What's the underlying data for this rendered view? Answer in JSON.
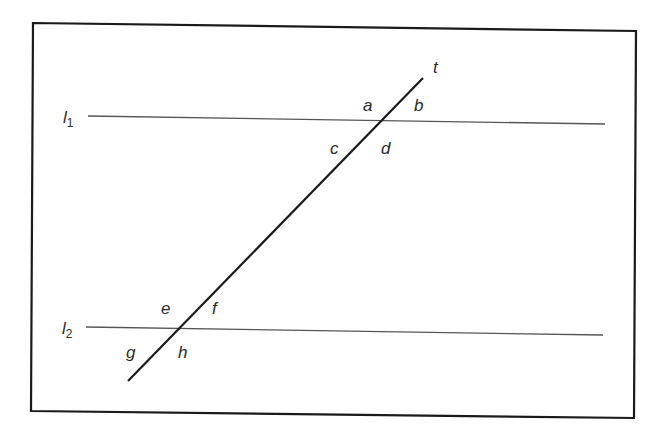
{
  "diagram": {
    "colors": {
      "frame": "#1a1a1a",
      "parallel_lines": "#555555",
      "transversal": "#1a1a1a",
      "labels": "#2a2a2a",
      "background": "#ffffff"
    },
    "lines": {
      "l1": {
        "name": "l",
        "subscript": "1"
      },
      "l2": {
        "name": "l",
        "subscript": "2"
      },
      "transversal": {
        "name": "t"
      }
    },
    "angles": {
      "a": "a",
      "b": "b",
      "c": "c",
      "d": "d",
      "e": "e",
      "f": "f",
      "g": "g",
      "h": "h"
    }
  }
}
